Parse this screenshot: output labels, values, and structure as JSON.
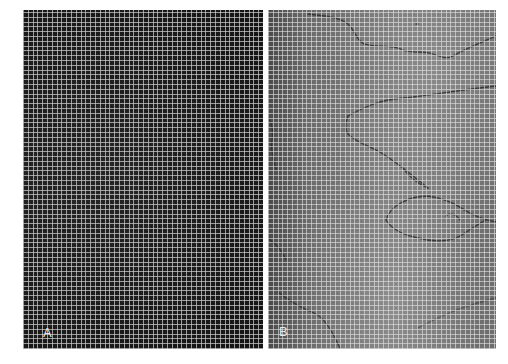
{
  "figure": {
    "panels": [
      {
        "id": "A",
        "label": "A",
        "description": "Dark uniform background with fine white square grid",
        "background_color": "#1e1e1e",
        "grid_color": "#cdcdcd"
      },
      {
        "id": "B",
        "label": "B",
        "description": "Medium gray background with fine white square grid and dark meandering vessel lines",
        "background_color": "#747474",
        "grid_color": "#e1e1e1",
        "vessel_color": "#2e2e2e"
      }
    ]
  }
}
